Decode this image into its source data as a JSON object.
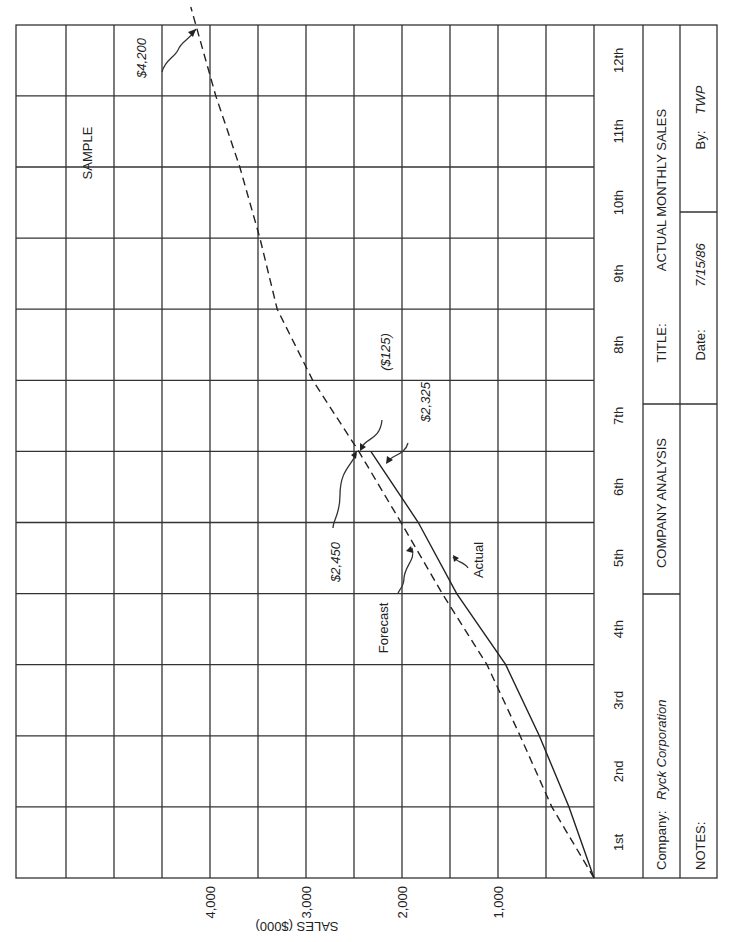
{
  "chart_data": {
    "type": "line",
    "title": "ACTUAL MONTHLY SALES",
    "xlabel": "Month",
    "ylabel": "SALES ($000)",
    "categories": [
      "1st",
      "2nd",
      "3rd",
      "4th",
      "5th",
      "6th",
      "7th",
      "8th",
      "9th",
      "10th",
      "11th",
      "12th"
    ],
    "x": [
      0,
      1,
      2,
      3,
      4,
      5,
      6,
      7,
      8,
      9,
      10,
      11,
      12
    ],
    "ylim": [
      0,
      4500
    ],
    "yticks": [
      1000,
      2000,
      3000,
      4000
    ],
    "ytick_labels": [
      "1,000",
      "2,000",
      "3,000",
      "4,000"
    ],
    "grid": true,
    "series": [
      {
        "name": "Forecast",
        "style": "dashed",
        "x": [
          0,
          1,
          2,
          3,
          4,
          5,
          6,
          7,
          8,
          9,
          10,
          11,
          12.25
        ],
        "values": [
          0,
          440,
          770,
          1115,
          1580,
          2010,
          2450,
          2930,
          3300,
          3480,
          3690,
          3940,
          4200
        ]
      },
      {
        "name": "Actual",
        "style": "solid",
        "x": [
          0,
          1,
          2,
          3,
          4,
          5,
          6
        ],
        "values": [
          0,
          260,
          570,
          920,
          1430,
          1830,
          2325
        ]
      }
    ],
    "annotations": [
      {
        "text": "$4,200",
        "target": "Forecast month 12"
      },
      {
        "text": "$2,450",
        "target": "Forecast month 7 start"
      },
      {
        "text": "$2,325",
        "target": "Actual month 7 start"
      },
      {
        "text": "($125)",
        "target": "variance"
      },
      {
        "text": "Forecast",
        "target": "dashed line"
      },
      {
        "text": "Actual",
        "target": "solid line"
      },
      {
        "text": "SAMPLE"
      }
    ]
  },
  "info": {
    "company_label": "Company:",
    "company_value": "Ryck Corporation",
    "center_label": "COMPANY ANALYSIS",
    "title_label": "TITLE:",
    "title_value": "ACTUAL MONTHLY SALES",
    "notes_label": "NOTES:",
    "date_label": "Date:",
    "date_value": "7/15/86",
    "by_label": "By:",
    "by_value": "TWP"
  },
  "labels": {
    "sample": "SAMPLE",
    "forecast_value": "$2,450",
    "actual_value": "$2,325",
    "variance": "($125)",
    "final_value": "$4,200",
    "forecast_name": "Forecast",
    "actual_name": "Actual",
    "yaxis_title": "SALES ($000)"
  }
}
